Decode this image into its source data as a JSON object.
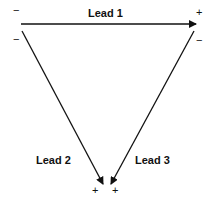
{
  "diagram": {
    "leads": [
      {
        "label": "Lead 1",
        "negative": "−",
        "positive": "+"
      },
      {
        "label": "Lead 2",
        "negative": "−",
        "positive": "+"
      },
      {
        "label": "Lead 3",
        "negative": "−",
        "positive": "+"
      }
    ],
    "line_color": "#111111"
  }
}
